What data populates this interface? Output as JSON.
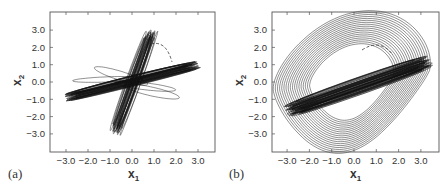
{
  "figure": {
    "panels": [
      {
        "id": "a",
        "label": "(a)",
        "xlabel": "x",
        "xlabel_sub": "1",
        "ylabel": "x",
        "ylabel_sub": "2",
        "xticks": [
          "−3.0",
          "−2.0",
          "−1.0",
          "0.0",
          "1.0",
          "2.0",
          "3.0"
        ],
        "yticks": [
          "3.0",
          "2.0",
          "1.0",
          "0.0",
          "−1.0",
          "−2.0",
          "−3.0"
        ]
      },
      {
        "id": "b",
        "label": "(b)",
        "xlabel": "x",
        "xlabel_sub": "1",
        "ylabel": "x",
        "ylabel_sub": "2",
        "xticks": [
          "−3.0",
          "−2.0",
          "−1.0",
          "0.0",
          "1.0",
          "2.0",
          "3.0"
        ],
        "yticks": [
          "3.0",
          "2.0",
          "1.0",
          "0.0",
          "−1.0",
          "−2.0",
          "−3.0"
        ]
      }
    ]
  },
  "chart_data": [
    {
      "type": "line",
      "title": "(a)",
      "xlabel": "x1",
      "ylabel": "x2",
      "xlim": [
        -3.8,
        3.8
      ],
      "ylim": [
        -4.0,
        4.0
      ],
      "xticks": [
        -3.0,
        -2.0,
        -1.0,
        0.0,
        1.0,
        2.0,
        3.0
      ],
      "yticks": [
        -3.0,
        -2.0,
        -1.0,
        0.0,
        1.0,
        2.0,
        3.0
      ],
      "grid": false,
      "series": [
        {
          "name": "trajectory (solid)",
          "description": "Phase-plane trajectory forming an X pattern: a steep band along roughly x2 = 3.5*x1 spanning x1 from about -0.8 to 0.9 (x2 from -3.0 to 3.0), and a shallow band along roughly x2 = 0.3*x1 spanning x1 from -3.0 to 3.0 (x2 from -0.9 to 1.0), with a few loose elliptical loops near the origin",
          "bands": [
            {
              "from": [
                -0.8,
                -3.0
              ],
              "to": [
                0.9,
                3.0
              ]
            },
            {
              "from": [
                -3.0,
                -0.9
              ],
              "to": [
                3.0,
                1.0
              ]
            }
          ]
        },
        {
          "name": "dashed arc",
          "style": "dashed",
          "points": [
            [
              0.9,
              1.8
            ],
            [
              1.5,
              1.6
            ],
            [
              1.9,
              1.0
            ]
          ]
        }
      ]
    },
    {
      "type": "line",
      "title": "(b)",
      "xlabel": "x1",
      "ylabel": "x2",
      "xlim": [
        -3.8,
        3.8
      ],
      "ylim": [
        -4.0,
        4.0
      ],
      "xticks": [
        -3.0,
        -2.0,
        -1.0,
        0.0,
        1.0,
        2.0,
        3.0
      ],
      "yticks": [
        -3.0,
        -2.0,
        -1.0,
        0.0,
        1.0,
        2.0,
        3.0
      ],
      "grid": false,
      "series": [
        {
          "name": "trajectory (solid)",
          "description": "Phase-plane trajectory with a dense shallow band along roughly x2 = 0.45*x1 spanning x1 from -3.0 to 3.4 (x2 from -1.7 to 1.2), enclosed by large nested loops extending from x1 about -2.2 to 2.0 and x2 about -2.3 to 2.0",
          "bands": [
            {
              "from": [
                -3.0,
                -1.7
              ],
              "to": [
                3.4,
                1.2
              ]
            }
          ],
          "envelope": {
            "x1": [
              -2.2,
              2.0
            ],
            "x2": [
              -2.3,
              2.0
            ]
          }
        },
        {
          "name": "dashed arc",
          "style": "dashed",
          "points": [
            [
              0.4,
              1.8
            ],
            [
              1.0,
              2.0
            ],
            [
              1.6,
              1.6
            ]
          ]
        }
      ]
    }
  ]
}
